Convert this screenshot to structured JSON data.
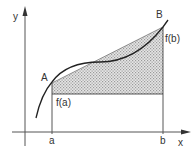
{
  "diagram": {
    "type": "mean-value / trapezoid area illustration",
    "axes": {
      "x_label": "x",
      "y_label": "y"
    },
    "points": {
      "A": {
        "label": "A",
        "x_tick": "a",
        "value_label": "f(a)"
      },
      "B": {
        "label": "B",
        "x_tick": "b",
        "value_label": "f(b)"
      }
    },
    "colors": {
      "stroke": "#333333",
      "axis": "#555555",
      "shade": "#c8c8c8"
    }
  }
}
